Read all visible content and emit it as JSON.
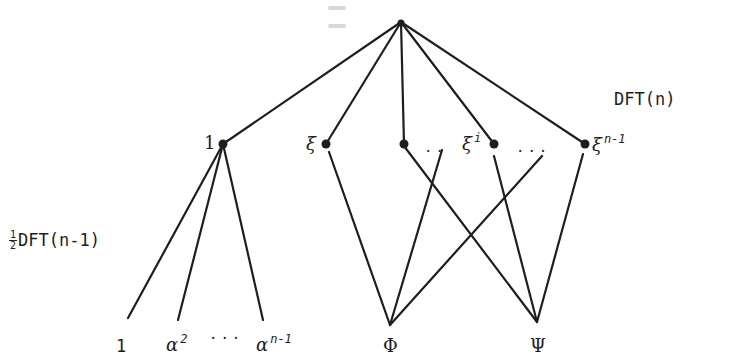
{
  "diagram": {
    "type": "tree",
    "colors": {
      "ink": "#1e1e1e",
      "background": "#ffffff"
    },
    "labels": {
      "dft_n": "DFT(n)",
      "half_dft_frac_num": "1",
      "half_dft_frac_den": "2",
      "half_dft": "DFT(n-1)"
    },
    "mid_nodes": [
      {
        "id": "one",
        "label": "1",
        "sup": ""
      },
      {
        "id": "xi",
        "label": "ξ",
        "sup": ""
      },
      {
        "id": "blank",
        "label": "",
        "sup": ""
      },
      {
        "id": "xi_i",
        "label": "ξ",
        "sup": "i"
      },
      {
        "id": "xi_n1",
        "label": "ξ",
        "sup": "n-1"
      }
    ],
    "ellipses": {
      "after_blank": "..",
      "after_xi_i": "...",
      "leaves": "···"
    },
    "leaves": [
      {
        "label": "1",
        "sup": ""
      },
      {
        "label": "α",
        "sup": "2"
      },
      {
        "label": "α",
        "sup": "n-1"
      },
      {
        "label": "Φ",
        "sup": ""
      },
      {
        "label": "Ψ",
        "sup": ""
      }
    ],
    "edges": [
      [
        "root",
        "one"
      ],
      [
        "root",
        "xi"
      ],
      [
        "root",
        "blank"
      ],
      [
        "root",
        "xi_i"
      ],
      [
        "root",
        "xi_n1"
      ],
      [
        "one",
        "leaf_1"
      ],
      [
        "one",
        "leaf_alpha2"
      ],
      [
        "one",
        "leaf_alpha_n1"
      ],
      [
        "xi",
        "Phi"
      ],
      [
        "blank",
        "Psi"
      ],
      [
        "dots1",
        "Phi"
      ],
      [
        "dots2",
        "Phi"
      ],
      [
        "xi_i",
        "Psi"
      ],
      [
        "xi_n1",
        "Psi"
      ]
    ]
  }
}
